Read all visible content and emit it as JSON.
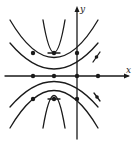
{
  "diagram": {
    "type": "solution curves / isoclines sketch",
    "axes": {
      "x_label": "x",
      "y_label": "y"
    },
    "colors": {
      "stroke": "#1a1a1a",
      "background": "#ffffff"
    },
    "points": {
      "x_axis_dots": 4,
      "upper_row_dots": 3,
      "lower_row_dots": 3
    },
    "tangent_marks": 2
  }
}
